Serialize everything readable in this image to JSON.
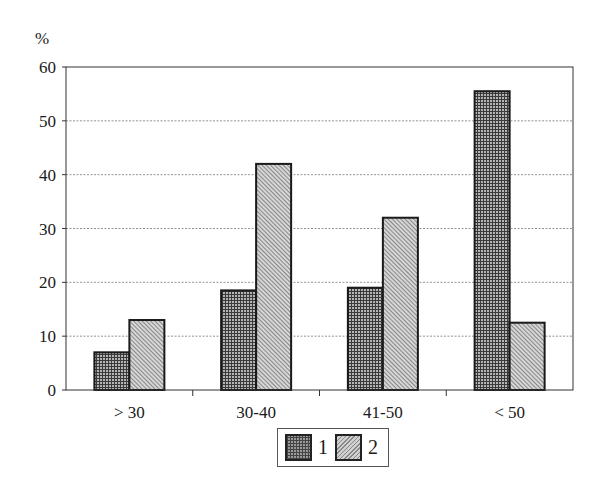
{
  "chart_data": {
    "type": "bar",
    "title": "",
    "xlabel": "",
    "ylabel": "%",
    "ylim": [
      0,
      60
    ],
    "yticks": [
      0,
      10,
      20,
      30,
      40,
      50,
      60
    ],
    "grid": true,
    "legend_position": "bottom-center",
    "categories": [
      "> 30",
      "30-40",
      "41-50",
      "< 50"
    ],
    "series": [
      {
        "name": "1",
        "values": [
          7,
          18.5,
          19,
          55.5
        ],
        "pattern": "crosshatch",
        "color": "#9a9a9a"
      },
      {
        "name": "2",
        "values": [
          13,
          42,
          32,
          12.5
        ],
        "pattern": "diagonal",
        "color": "#d0d0d0"
      }
    ]
  },
  "axis": {
    "unit_label": "%",
    "y_tick_labels": [
      "0",
      "10",
      "20",
      "30",
      "40",
      "50",
      "60"
    ]
  },
  "legend": {
    "items": [
      {
        "label": "1"
      },
      {
        "label": "2"
      }
    ]
  }
}
